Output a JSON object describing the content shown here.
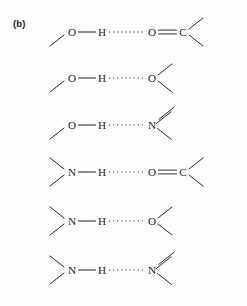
{
  "figure": {
    "panel_label": "(b)",
    "ink_color": "#1d1d1d",
    "background_color": "#fdfdfb"
  },
  "chart_data": {
    "type": "diagram",
    "title": "(b)",
    "rows": [
      {
        "id": "row-1",
        "donor": "O",
        "hydrogen": "H",
        "acceptor": "O",
        "acceptor_substituent": "C",
        "acceptor_bond_order": "double",
        "covalent_link": "—",
        "hydrogen_bond": "······",
        "notation": "O—H·····O=C",
        "donor_stub_count": 1,
        "acceptor_stub_count": 0,
        "tail_stub_count": 2,
        "y": 32
      },
      {
        "id": "row-2",
        "donor": "O",
        "hydrogen": "H",
        "acceptor": "O",
        "acceptor_substituent": "",
        "acceptor_bond_order": "none",
        "covalent_link": "—",
        "hydrogen_bond": "······",
        "notation": "O—H·····O",
        "donor_stub_count": 1,
        "acceptor_stub_count": 2,
        "tail_stub_count": 0,
        "y": 78
      },
      {
        "id": "row-3",
        "donor": "O",
        "hydrogen": "H",
        "acceptor": "N",
        "acceptor_substituent": "",
        "acceptor_bond_order": "double-stub",
        "covalent_link": "—",
        "hydrogen_bond": "·····",
        "notation": "O—H····N",
        "donor_stub_count": 1,
        "acceptor_stub_count": 2,
        "tail_stub_count": 0,
        "y": 125
      },
      {
        "id": "row-4",
        "donor": "N",
        "hydrogen": "H",
        "acceptor": "O",
        "acceptor_substituent": "C",
        "acceptor_bond_order": "double",
        "covalent_link": "—",
        "hydrogen_bond": "······",
        "notation": "N—H·····O=C",
        "donor_stub_count": 2,
        "acceptor_stub_count": 0,
        "tail_stub_count": 2,
        "y": 172
      },
      {
        "id": "row-5",
        "donor": "N",
        "hydrogen": "H",
        "acceptor": "O",
        "acceptor_substituent": "",
        "acceptor_bond_order": "none",
        "covalent_link": "—",
        "hydrogen_bond": "·····",
        "notation": "N—H····O",
        "donor_stub_count": 2,
        "acceptor_stub_count": 2,
        "tail_stub_count": 0,
        "y": 221
      },
      {
        "id": "row-6",
        "donor": "N",
        "hydrogen": "H",
        "acceptor": "N",
        "acceptor_substituent": "",
        "acceptor_bond_order": "double-stub",
        "covalent_link": "—",
        "hydrogen_bond": "·····",
        "notation": "N—H····N",
        "donor_stub_count": 2,
        "acceptor_stub_count": 2,
        "tail_stub_count": 0,
        "y": 270
      }
    ]
  }
}
